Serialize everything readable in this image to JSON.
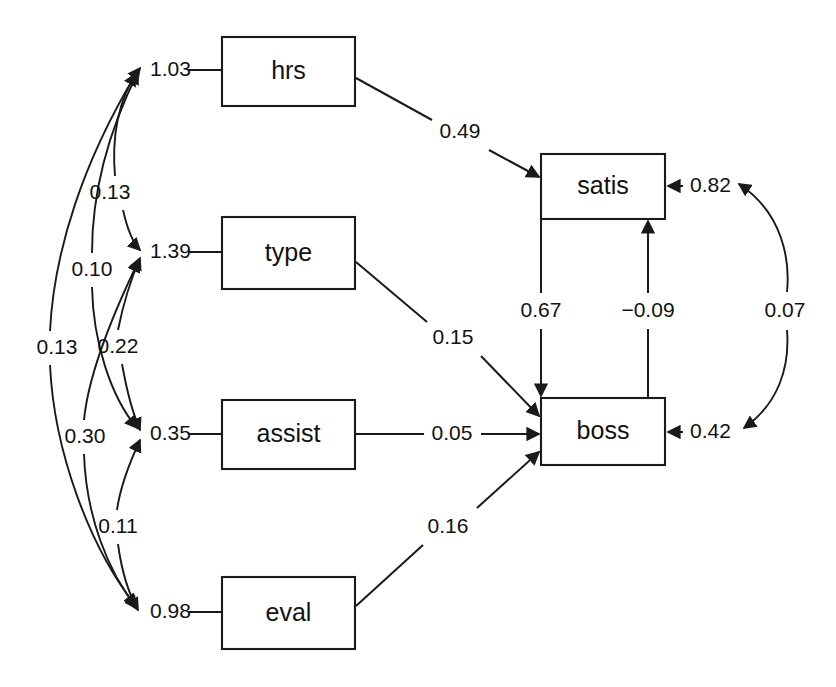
{
  "diagram": {
    "type": "sem-path-diagram",
    "title": "",
    "background_color": "#ffffff",
    "line_color": "#1a1a1a",
    "text_color": "#111111",
    "width": 836,
    "height": 687
  },
  "nodes": [
    {
      "id": "hrs",
      "label": "hrs",
      "x": 222,
      "y": 37,
      "w": 133,
      "h": 69
    },
    {
      "id": "type",
      "label": "type",
      "x": 222,
      "y": 217,
      "w": 133,
      "h": 72
    },
    {
      "id": "assist",
      "label": "assist",
      "x": 222,
      "y": 400,
      "w": 133,
      "h": 69
    },
    {
      "id": "eval",
      "label": "eval",
      "x": 222,
      "y": 577,
      "w": 133,
      "h": 72
    },
    {
      "id": "satis",
      "label": "satis",
      "x": 541,
      "y": 154,
      "w": 124,
      "h": 65
    },
    {
      "id": "boss",
      "label": "boss",
      "x": 541,
      "y": 398,
      "w": 124,
      "h": 67
    }
  ],
  "exogenous_variances": [
    {
      "id": "var-hrs",
      "value": "1.03",
      "for": "hrs",
      "x": 150,
      "y": 70
    },
    {
      "id": "var-type",
      "value": "1.39",
      "for": "type",
      "x": 150,
      "y": 252
    },
    {
      "id": "var-assist",
      "value": "0.35",
      "for": "assist",
      "x": 150,
      "y": 434
    },
    {
      "id": "var-eval",
      "value": "0.98",
      "for": "eval",
      "x": 150,
      "y": 612
    }
  ],
  "error_variances": [
    {
      "id": "err-satis",
      "value": "0.82",
      "for": "satis",
      "x": 690,
      "y": 186
    },
    {
      "id": "err-boss",
      "value": "0.42",
      "for": "boss",
      "x": 690,
      "y": 432
    }
  ],
  "covariances": [
    {
      "id": "cov-hrs-type",
      "value": "0.13",
      "from": "hrs",
      "to": "type",
      "label_x": 110,
      "label_y": 193
    },
    {
      "id": "cov-hrs-assist",
      "value": "0.10",
      "from": "hrs",
      "to": "assist",
      "label_x": 92,
      "label_y": 270
    },
    {
      "id": "cov-hrs-eval",
      "value": "0.13",
      "from": "hrs",
      "to": "eval",
      "label_x": 57,
      "label_y": 348
    },
    {
      "id": "cov-type-assist",
      "value": "0.22",
      "from": "type",
      "to": "assist",
      "label_x": 118,
      "label_y": 347
    },
    {
      "id": "cov-type-eval",
      "value": "0.30",
      "from": "type",
      "to": "eval",
      "label_x": 85,
      "label_y": 437
    },
    {
      "id": "cov-assist-eval",
      "value": "0.11",
      "from": "assist",
      "to": "eval",
      "label_x": 118,
      "label_y": 527
    },
    {
      "id": "cov-err",
      "value": "0.07",
      "from": "err-satis",
      "to": "err-boss",
      "label_x": 785,
      "label_y": 311
    }
  ],
  "paths": [
    {
      "id": "path-hrs-satis",
      "value": "0.49",
      "from": "hrs",
      "to": "satis",
      "label_x": 460,
      "label_y": 132
    },
    {
      "id": "path-type-boss",
      "value": "0.15",
      "from": "type",
      "to": "boss",
      "label_x": 453,
      "label_y": 338
    },
    {
      "id": "path-assist-boss",
      "value": "0.05",
      "from": "assist",
      "to": "boss",
      "label_x": 452,
      "label_y": 434
    },
    {
      "id": "path-eval-boss",
      "value": "0.16",
      "from": "eval",
      "to": "boss",
      "label_x": 448,
      "label_y": 527
    },
    {
      "id": "path-satis-boss",
      "value": "0.67",
      "from": "satis",
      "to": "boss",
      "label_x": 541,
      "label_y": 311
    },
    {
      "id": "path-boss-satis",
      "value": "−0.09",
      "from": "boss",
      "to": "satis",
      "label_x": 648,
      "label_y": 311
    }
  ]
}
